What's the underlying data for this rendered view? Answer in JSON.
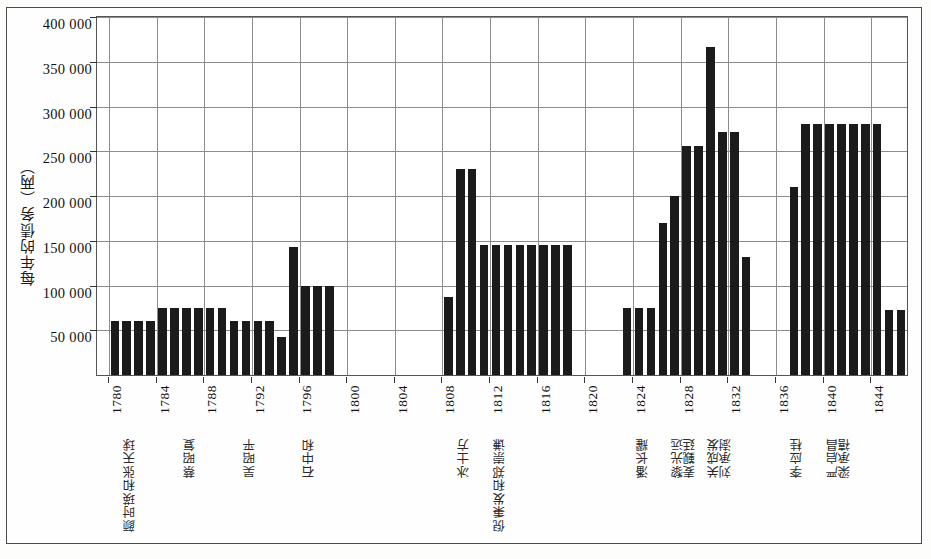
{
  "chart_data": {
    "type": "bar",
    "title": "",
    "xlabel": "",
    "ylabel": "每年的债务（两）",
    "ylim": [
      0,
      400000
    ],
    "ytick_labels": [
      "400 000",
      "350 000",
      "300 000",
      "250 000",
      "200 000",
      "150 000",
      "100 000",
      "50 000"
    ],
    "ytick_values": [
      400000,
      350000,
      300000,
      250000,
      200000,
      150000,
      100000,
      50000
    ],
    "ytick_step": 50000,
    "grid": true,
    "legend": false,
    "xlim": [
      1779,
      1847
    ],
    "xtick_labels": [
      "1780",
      "1784",
      "1788",
      "1792",
      "1796",
      "1800",
      "1804",
      "1808",
      "1812",
      "1816",
      "1820",
      "1824",
      "1828",
      "1832",
      "1836",
      "1840",
      "1844"
    ],
    "xtick_values": [
      1780,
      1784,
      1788,
      1792,
      1796,
      1800,
      1804,
      1808,
      1812,
      1816,
      1820,
      1824,
      1828,
      1832,
      1836,
      1840,
      1844
    ],
    "x": [
      1780,
      1781,
      1782,
      1783,
      1784,
      1785,
      1786,
      1787,
      1788,
      1789,
      1790,
      1791,
      1792,
      1793,
      1794,
      1795,
      1796,
      1797,
      1798,
      1799,
      1800,
      1801,
      1808,
      1809,
      1810,
      1811,
      1812,
      1813,
      1814,
      1815,
      1816,
      1817,
      1818,
      1819,
      1820,
      1823,
      1824,
      1825,
      1826,
      1827,
      1828,
      1829,
      1830,
      1831,
      1832,
      1833,
      1837,
      1838,
      1839,
      1840,
      1841,
      1842,
      1843,
      1844,
      1845,
      1846
    ],
    "values": [
      60000,
      60000,
      60000,
      60000,
      75000,
      75000,
      75000,
      75000,
      75000,
      75000,
      60000,
      60000,
      60000,
      60000,
      43000,
      143000,
      100000,
      100000,
      100000,
      0,
      0,
      0,
      87000,
      230000,
      230000,
      145000,
      145000,
      145000,
      145000,
      145000,
      145000,
      145000,
      145000,
      0,
      0,
      75000,
      75000,
      75000,
      170000,
      200000,
      256000,
      256000,
      367000,
      272000,
      272000,
      132000,
      210000,
      280000,
      280000,
      280000,
      280000,
      280000,
      280000,
      280000,
      73000,
      73000
    ],
    "bars": [
      {
        "year": 1780,
        "value": 60000
      },
      {
        "year": 1781,
        "value": 60000
      },
      {
        "year": 1782,
        "value": 60000
      },
      {
        "year": 1783,
        "value": 60000
      },
      {
        "year": 1784,
        "value": 75000
      },
      {
        "year": 1785,
        "value": 75000
      },
      {
        "year": 1786,
        "value": 75000
      },
      {
        "year": 1787,
        "value": 75000
      },
      {
        "year": 1788,
        "value": 75000
      },
      {
        "year": 1789,
        "value": 75000
      },
      {
        "year": 1790,
        "value": 60000
      },
      {
        "year": 1791,
        "value": 60000
      },
      {
        "year": 1792,
        "value": 60000
      },
      {
        "year": 1793,
        "value": 60000
      },
      {
        "year": 1794,
        "value": 43000
      },
      {
        "year": 1795,
        "value": 143000
      },
      {
        "year": 1796,
        "value": 100000
      },
      {
        "year": 1797,
        "value": 100000
      },
      {
        "year": 1798,
        "value": 100000
      },
      {
        "year": 1808,
        "value": 87000
      },
      {
        "year": 1809,
        "value": 230000
      },
      {
        "year": 1810,
        "value": 230000
      },
      {
        "year": 1811,
        "value": 145000
      },
      {
        "year": 1812,
        "value": 145000
      },
      {
        "year": 1813,
        "value": 145000
      },
      {
        "year": 1814,
        "value": 145000
      },
      {
        "year": 1815,
        "value": 145000
      },
      {
        "year": 1816,
        "value": 145000
      },
      {
        "year": 1817,
        "value": 145000
      },
      {
        "year": 1818,
        "value": 145000
      },
      {
        "year": 1823,
        "value": 75000
      },
      {
        "year": 1824,
        "value": 75000
      },
      {
        "year": 1825,
        "value": 75000
      },
      {
        "year": 1826,
        "value": 170000
      },
      {
        "year": 1827,
        "value": 200000
      },
      {
        "year": 1828,
        "value": 256000
      },
      {
        "year": 1829,
        "value": 256000
      },
      {
        "year": 1830,
        "value": 367000
      },
      {
        "year": 1831,
        "value": 272000
      },
      {
        "year": 1832,
        "value": 272000
      },
      {
        "year": 1833,
        "value": 132000
      },
      {
        "year": 1837,
        "value": 210000
      },
      {
        "year": 1838,
        "value": 280000
      },
      {
        "year": 1839,
        "value": 280000
      },
      {
        "year": 1840,
        "value": 280000
      },
      {
        "year": 1841,
        "value": 280000
      },
      {
        "year": 1842,
        "value": 280000
      },
      {
        "year": 1843,
        "value": 280000
      },
      {
        "year": 1844,
        "value": 280000
      },
      {
        "year": 1845,
        "value": 73000
      },
      {
        "year": 1846,
        "value": 73000
      }
    ],
    "merchant_annotations": [
      {
        "name": "颜时瑛和张天球",
        "year": 1781
      },
      {
        "name": "蔡昭复",
        "year": 1786
      },
      {
        "name": "吴昭平",
        "year": 1791
      },
      {
        "name": "石中和",
        "year": 1796
      },
      {
        "name": "冰士方",
        "year": 1809
      },
      {
        "name": "倪秉发和郑崇谦",
        "year": 1812
      },
      {
        "name": "潘长耀",
        "year": 1824
      },
      {
        "name": "黎光远",
        "year": 1827
      },
      {
        "name": "麦觐廷",
        "year": 1828
      },
      {
        "name": "关成发",
        "year": 1830
      },
      {
        "name": "刘承澍",
        "year": 1831
      },
      {
        "name": "李应桂",
        "year": 1837
      },
      {
        "name": "严启昌",
        "year": 1840
      },
      {
        "name": "梁承禧",
        "year": 1841
      }
    ],
    "bar_color": "#1b1b1b",
    "grid_color": "#8c8c8c",
    "background_color": "#ffffff"
  }
}
